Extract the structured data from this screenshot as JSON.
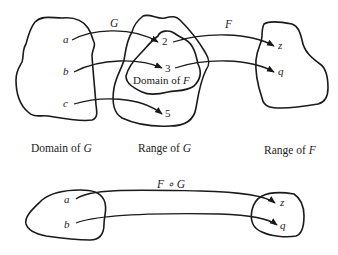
{
  "diagram": {
    "top": {
      "sets": {
        "domain_g": {
          "elements": [
            "a",
            "b",
            "c"
          ]
        },
        "range_g": {
          "elements": [
            "2",
            "3",
            "5"
          ],
          "inner_label": "Domain of F"
        },
        "range_f": {
          "elements": [
            "z",
            "q"
          ]
        }
      },
      "function_labels": {
        "g": "G",
        "f": "F"
      },
      "mappings_g": [
        {
          "from": "a",
          "to": "2"
        },
        {
          "from": "b",
          "to": "3"
        },
        {
          "from": "c",
          "to": "5"
        }
      ],
      "mappings_f": [
        {
          "from": "2",
          "to": "z"
        },
        {
          "from": "3",
          "to": "q"
        }
      ]
    },
    "captions": {
      "domain_g": {
        "prefix": "Domain of ",
        "var": "G"
      },
      "range_g": {
        "prefix": "Range of ",
        "var": "G"
      },
      "range_f": {
        "prefix": "Range of ",
        "var": "F"
      }
    },
    "inner_caption": {
      "prefix": "Domain of ",
      "var": "F"
    },
    "bottom": {
      "composition_label": "F ∘ G",
      "left_elements": [
        "a",
        "b"
      ],
      "right_elements": [
        "z",
        "q"
      ],
      "mappings": [
        {
          "from": "a",
          "to": "z"
        },
        {
          "from": "b",
          "to": "q"
        }
      ]
    }
  }
}
